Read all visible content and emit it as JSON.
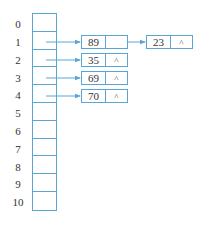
{
  "diagram": {
    "type": "hash-table-chaining",
    "line_color": "#5aa5d6",
    "index_labels": [
      "0",
      "1",
      "2",
      "3",
      "4",
      "5",
      "6",
      "7",
      "8",
      "9",
      "10"
    ],
    "null_symbol": "^",
    "chains": [
      {
        "index": "1",
        "nodes": [
          {
            "value": "89",
            "next": "→"
          },
          {
            "value": "23",
            "next": "^"
          }
        ]
      },
      {
        "index": "2",
        "nodes": [
          {
            "value": "35",
            "next": "^"
          }
        ]
      },
      {
        "index": "3",
        "nodes": [
          {
            "value": "69",
            "next": "^"
          }
        ]
      },
      {
        "index": "4",
        "nodes": [
          {
            "value": "70",
            "next": "^"
          }
        ]
      }
    ]
  }
}
